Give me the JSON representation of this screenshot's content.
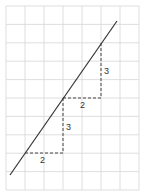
{
  "diagram": {
    "type": "slope-triangles-on-grid",
    "grid": {
      "columns": 7,
      "rows": 10,
      "origin_x": 6,
      "origin_y": 6,
      "cell_w": 19,
      "cell_h": 18.4,
      "color": "#d6d6d6"
    },
    "line": {
      "x1": 10,
      "y1": 175,
      "x2": 117,
      "y2": 21,
      "color": "#333333"
    },
    "steps": [
      {
        "run_label": "2",
        "rise_label": "3",
        "start": [
          25,
          153
        ],
        "corner": [
          63,
          153
        ],
        "end": [
          63,
          98
        ]
      },
      {
        "run_label": "2",
        "rise_label": "3",
        "start": [
          63,
          98
        ],
        "corner": [
          101,
          98
        ],
        "end": [
          101,
          42
        ]
      }
    ],
    "dash_color": "#444444"
  }
}
